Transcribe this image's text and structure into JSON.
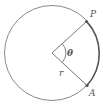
{
  "diagram": {
    "labels": {
      "point_p": "P",
      "point_a": "A",
      "angle": "θ",
      "radius": "r"
    },
    "colors": {
      "circle": "#777777",
      "arc": "#555555",
      "radius_lines": "#666666",
      "points": "#555555",
      "text": "#555555"
    }
  }
}
